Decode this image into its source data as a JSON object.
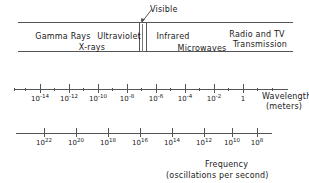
{
  "chart_data": {
    "type": "bar",
    "xlabel": "Wavelength (meters)",
    "ylabel": "",
    "bands": [
      {
        "label": "Gamma Rays",
        "x": 63,
        "y": 33
      },
      {
        "label": "Ultraviolet",
        "x": 119,
        "y": 33
      },
      {
        "label": "X-rays",
        "x": 92,
        "y": 44
      },
      {
        "label": "Infrared",
        "x": 173,
        "y": 33
      },
      {
        "label": "Microwaves",
        "x": 202,
        "y": 45
      },
      {
        "label": "Radio and TV",
        "x": 257,
        "y": 31
      },
      {
        "label": "Transmission",
        "x": 260,
        "y": 41
      }
    ],
    "visible": {
      "label": "Visible",
      "label_x": 150,
      "label_y": 6,
      "band_left_px": 139,
      "band_right_px": 146
    },
    "wavelength_axis": {
      "title_line1": "Wavelength",
      "title_line2": "(meters)",
      "title_x": 262,
      "title_y1": 93,
      "title_y2": 102,
      "axis_y": 89,
      "axis_left": 14,
      "axis_right": 288,
      "ticks": [
        {
          "label": "10",
          "exp": "-14",
          "x": 40,
          "major": true
        },
        {
          "label": "10",
          "exp": "-12",
          "x": 69,
          "major": true
        },
        {
          "label": "10",
          "exp": "-10",
          "x": 98,
          "major": true
        },
        {
          "label": "10",
          "exp": "-8",
          "x": 127,
          "major": true
        },
        {
          "label": "10",
          "exp": "-6",
          "x": 156,
          "major": true
        },
        {
          "label": "10",
          "exp": "-4",
          "x": 185,
          "major": true
        },
        {
          "label": "10",
          "exp": "-2",
          "x": 214,
          "major": true
        },
        {
          "label": "1",
          "exp": "",
          "x": 243,
          "major": true
        }
      ],
      "minor_ticks_x": [
        14,
        25,
        54,
        83,
        112,
        141,
        170,
        199,
        228,
        257,
        272
      ]
    },
    "frequency_axis": {
      "title_line1": "Frequency",
      "title_line2": "(oscillations per second)",
      "title_x": 205,
      "title_y1": 161,
      "title_y2": 172,
      "axis_y": 133,
      "axis_left": 16,
      "axis_right": 272,
      "ticks": [
        {
          "label": "10",
          "exp": "22",
          "x": 44,
          "major": true
        },
        {
          "label": "10",
          "exp": "20",
          "x": 76,
          "major": true
        },
        {
          "label": "10",
          "exp": "18",
          "x": 108,
          "major": true
        },
        {
          "label": "10",
          "exp": "16",
          "x": 140,
          "major": true
        },
        {
          "label": "10",
          "exp": "14",
          "x": 172,
          "major": true
        },
        {
          "label": "10",
          "exp": "12",
          "x": 204,
          "major": true
        },
        {
          "label": "10",
          "exp": "10",
          "x": 232,
          "major": true
        },
        {
          "label": "10",
          "exp": "8",
          "x": 257,
          "major": true
        }
      ],
      "minor_ticks_x": []
    },
    "colors": {
      "line": "#555555",
      "text": "#1a1a1a",
      "background": "#ffffff"
    },
    "grid": false,
    "legend": "none"
  }
}
